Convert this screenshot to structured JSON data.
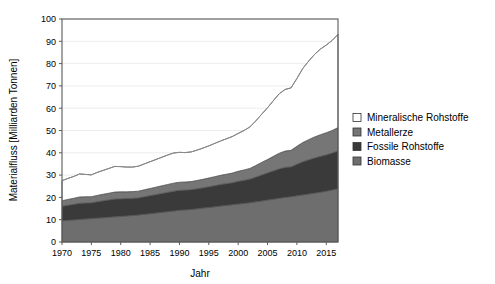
{
  "chart_data": {
    "type": "area",
    "stacked": true,
    "title": "",
    "xlabel": "Jahr",
    "ylabel": "Materialfluss [Milliarden Tonnen]",
    "xlim": [
      1970,
      2017
    ],
    "ylim": [
      0,
      100
    ],
    "ytick_step": 10,
    "xtick_step": 5,
    "grid": "horizontal",
    "legend_position": "right",
    "yticks": [
      "0",
      "10",
      "20",
      "30",
      "40",
      "50",
      "60",
      "70",
      "80",
      "90",
      "100"
    ],
    "xticks": [
      "1970",
      "1975",
      "1980",
      "1985",
      "1990",
      "1995",
      "2000",
      "2005",
      "2010",
      "2015"
    ],
    "x": [
      1970,
      1971,
      1972,
      1973,
      1974,
      1975,
      1976,
      1977,
      1978,
      1979,
      1980,
      1981,
      1982,
      1983,
      1984,
      1985,
      1986,
      1987,
      1988,
      1989,
      1990,
      1991,
      1992,
      1993,
      1994,
      1995,
      1996,
      1997,
      1998,
      1999,
      2000,
      2001,
      2002,
      2003,
      2004,
      2005,
      2006,
      2007,
      2008,
      2009,
      2010,
      2011,
      2012,
      2013,
      2014,
      2015,
      2016,
      2017
    ],
    "series": [
      {
        "name": "Biomasse",
        "color": "#6e6e6e",
        "values": [
          9.5,
          9.7,
          9.9,
          10.1,
          10.3,
          10.5,
          10.7,
          10.9,
          11.1,
          11.3,
          11.5,
          11.7,
          11.9,
          12.1,
          12.4,
          12.7,
          13.0,
          13.3,
          13.6,
          13.9,
          14.2,
          14.4,
          14.6,
          14.9,
          15.2,
          15.5,
          15.8,
          16.1,
          16.4,
          16.7,
          17.0,
          17.3,
          17.6,
          18.0,
          18.4,
          18.8,
          19.2,
          19.6,
          20.0,
          20.3,
          20.7,
          21.1,
          21.5,
          21.9,
          22.3,
          22.8,
          23.3,
          23.9
        ]
      },
      {
        "name": "Fossile Rohstoffe",
        "color": "#3a3a3a",
        "values": [
          6.5,
          6.8,
          7.0,
          7.3,
          7.2,
          7.1,
          7.4,
          7.6,
          7.8,
          8.0,
          7.9,
          7.8,
          7.7,
          7.7,
          7.9,
          8.1,
          8.3,
          8.5,
          8.7,
          8.9,
          9.0,
          8.9,
          8.9,
          9.0,
          9.1,
          9.3,
          9.5,
          9.7,
          9.8,
          9.9,
          10.2,
          10.4,
          10.6,
          11.1,
          11.7,
          12.2,
          12.7,
          13.2,
          13.5,
          13.4,
          14.2,
          14.9,
          15.4,
          15.8,
          16.1,
          16.3,
          16.6,
          17.0
        ]
      },
      {
        "name": "Metallerze",
        "color": "#767676",
        "values": [
          2.5,
          2.6,
          2.7,
          2.8,
          2.8,
          2.7,
          2.8,
          2.9,
          3.0,
          3.1,
          3.1,
          3.0,
          3.0,
          3.0,
          3.1,
          3.2,
          3.3,
          3.4,
          3.5,
          3.6,
          3.6,
          3.6,
          3.6,
          3.7,
          3.8,
          3.9,
          4.0,
          4.1,
          4.2,
          4.3,
          4.5,
          4.6,
          4.8,
          5.2,
          5.6,
          6.0,
          6.5,
          7.0,
          7.3,
          7.4,
          8.0,
          8.6,
          9.0,
          9.4,
          9.7,
          9.9,
          10.1,
          10.4
        ]
      },
      {
        "name": "Mineralische Rohstoffe",
        "color": "#ffffff",
        "values": [
          9.0,
          9.4,
          9.8,
          10.3,
          10.0,
          9.8,
          10.3,
          10.7,
          11.1,
          11.5,
          11.3,
          11.1,
          11.0,
          11.2,
          11.6,
          12.0,
          12.4,
          12.8,
          13.2,
          13.5,
          13.4,
          13.2,
          13.3,
          13.6,
          14.0,
          14.4,
          14.9,
          15.4,
          15.9,
          16.4,
          17.0,
          17.7,
          18.6,
          20.0,
          21.6,
          23.2,
          25.0,
          26.7,
          27.6,
          28.0,
          30.4,
          33.2,
          35.2,
          37.0,
          38.4,
          39.3,
          40.4,
          41.8
        ]
      }
    ],
    "totals_note": "Stacked totals rise from about 27.5 in 1970 to about 93 in 2017"
  },
  "legend": {
    "items": [
      {
        "label": "Mineralische Rohstoffe",
        "swatch": "#ffffff"
      },
      {
        "label": "Metallerze",
        "swatch": "#767676"
      },
      {
        "label": "Fossile Rohstoffe",
        "swatch": "#3a3a3a"
      },
      {
        "label": "Biomasse",
        "swatch": "#6e6e6e"
      }
    ]
  }
}
